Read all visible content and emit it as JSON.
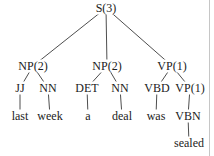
{
  "figure": {
    "kind": "constituency-parse-tree",
    "colors": {
      "text": "#1b1b1b",
      "line": "#3a3a3a",
      "background": "#ffffff",
      "right_rule": "#c6c6c6"
    },
    "right_rule_x": 209
  },
  "nodes": [
    {
      "id": "S",
      "label": "S(3)",
      "x": 106,
      "y": 8
    },
    {
      "id": "NP1",
      "label": "NP(2)",
      "x": 33,
      "y": 66
    },
    {
      "id": "NP2",
      "label": "NP(2)",
      "x": 107,
      "y": 66
    },
    {
      "id": "VP",
      "label": "VP(1)",
      "x": 172,
      "y": 66
    },
    {
      "id": "JJ",
      "label": "JJ",
      "x": 20,
      "y": 88
    },
    {
      "id": "NN1",
      "label": "NN",
      "x": 48,
      "y": 88
    },
    {
      "id": "DET",
      "label": "DET",
      "x": 87,
      "y": 88
    },
    {
      "id": "NN2",
      "label": "NN",
      "x": 120,
      "y": 88
    },
    {
      "id": "VBD",
      "label": "VBD",
      "x": 157,
      "y": 88
    },
    {
      "id": "VP1",
      "label": "VP(1)",
      "x": 190,
      "y": 88
    },
    {
      "id": "last",
      "label": "last",
      "x": 20,
      "y": 116
    },
    {
      "id": "week",
      "label": "week",
      "x": 50,
      "y": 116
    },
    {
      "id": "a",
      "label": "a",
      "x": 88,
      "y": 116
    },
    {
      "id": "deal",
      "label": "deal",
      "x": 122,
      "y": 116
    },
    {
      "id": "was",
      "label": "was",
      "x": 156,
      "y": 116
    },
    {
      "id": "VBN",
      "label": "VBN",
      "x": 188,
      "y": 116
    },
    {
      "id": "sealed",
      "label": "sealed",
      "x": 189,
      "y": 143
    }
  ],
  "edges": [
    [
      "S",
      "NP1"
    ],
    [
      "S",
      "NP2"
    ],
    [
      "S",
      "VP"
    ],
    [
      "NP1",
      "JJ"
    ],
    [
      "NP1",
      "NN1"
    ],
    [
      "NP2",
      "DET"
    ],
    [
      "NP2",
      "NN2"
    ],
    [
      "VP",
      "VBD"
    ],
    [
      "VP",
      "VP1"
    ],
    [
      "JJ",
      "last"
    ],
    [
      "NN1",
      "week"
    ],
    [
      "DET",
      "a"
    ],
    [
      "NN2",
      "deal"
    ],
    [
      "VBD",
      "was"
    ],
    [
      "VP1",
      "VBN"
    ],
    [
      "VBN",
      "sealed"
    ]
  ]
}
